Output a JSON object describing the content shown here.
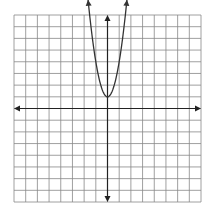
{
  "chart_data": {
    "type": "line",
    "title": "",
    "xlabel": "",
    "ylabel": "",
    "xlim": [
      -8,
      8
    ],
    "ylim": [
      -8,
      8
    ],
    "grid": true,
    "grid_step": 1,
    "axes_arrows": true,
    "series": [
      {
        "name": "parabola",
        "equation": "y = 3x^2 + 1",
        "vertex": [
          0,
          1
        ],
        "points": [
          [
            -1.63,
            9
          ],
          [
            -1,
            4
          ],
          [
            0,
            1
          ],
          [
            1,
            4
          ],
          [
            1.63,
            9
          ]
        ],
        "arrow_ends": true
      }
    ]
  },
  "layout": {
    "grid_left": 14,
    "grid_top": 15,
    "grid_size": 187,
    "cells": 16,
    "colors": {
      "grid": "#888888",
      "axis": "#222222",
      "curve": "#333333"
    }
  }
}
